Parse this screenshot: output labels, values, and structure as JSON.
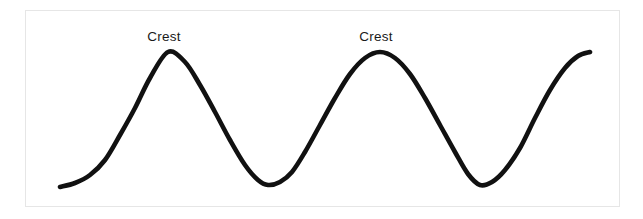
{
  "figure": {
    "kind": "wave-diagram",
    "background_color": "#ffffff",
    "frame": {
      "border_color": "#e6e6e6",
      "x": 25,
      "y": 10,
      "width": 595,
      "height": 197
    },
    "curve": {
      "stroke_color": "#111111",
      "stroke_width": 4.6,
      "start_point": {
        "x": 60,
        "y": 187
      },
      "end_point": {
        "x": 590,
        "y": 52
      }
    },
    "labels": [
      {
        "id": "crest-1",
        "text": "Crest",
        "x": 164,
        "y": 30
      },
      {
        "id": "crest-2",
        "text": "Crest",
        "x": 376,
        "y": 30
      }
    ]
  },
  "chart_data": {
    "type": "line",
    "title": "",
    "xlabel": "",
    "ylabel": "",
    "grid": false,
    "legend": "none",
    "xlim": [
      60,
      590
    ],
    "ylim": [
      52,
      187
    ],
    "annotations": [
      {
        "label": "Crest",
        "x": 168,
        "y": 52
      },
      {
        "label": "Crest",
        "x": 380,
        "y": 52
      }
    ],
    "series": [
      {
        "name": "wave",
        "color": "#111111",
        "key_points": [
          {
            "role": "start",
            "x": 60,
            "y": 187
          },
          {
            "role": "crest",
            "x": 168,
            "y": 52
          },
          {
            "role": "trough",
            "x": 268,
            "y": 185
          },
          {
            "role": "crest",
            "x": 380,
            "y": 52
          },
          {
            "role": "trough",
            "x": 480,
            "y": 185
          },
          {
            "role": "end",
            "x": 590,
            "y": 52
          }
        ],
        "x": [
          60,
          75,
          90,
          105,
          120,
          135,
          150,
          168,
          185,
          200,
          215,
          230,
          245,
          258,
          268,
          280,
          292,
          305,
          320,
          335,
          350,
          365,
          380,
          395,
          410,
          425,
          440,
          455,
          468,
          480,
          492,
          505,
          520,
          535,
          550,
          565,
          578,
          590
        ],
        "y": [
          187,
          183,
          175,
          160,
          135,
          108,
          78,
          52,
          62,
          85,
          112,
          140,
          165,
          180,
          185,
          182,
          172,
          152,
          125,
          98,
          74,
          58,
          52,
          58,
          74,
          98,
          125,
          152,
          174,
          185,
          182,
          170,
          148,
          118,
          90,
          68,
          56,
          52
        ]
      }
    ]
  }
}
